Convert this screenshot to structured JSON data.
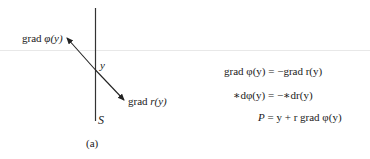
{
  "figure": {
    "caption": "(a)",
    "surface_label": "S",
    "point_label": "y",
    "arrow_up_left_label": {
      "prefix": "grad ",
      "func": "φ",
      "arg": "(y)"
    },
    "arrow_down_right_label": {
      "prefix": "grad ",
      "func": "r",
      "arg": "(y)"
    }
  },
  "equations": [
    {
      "lhs": "grad φ(y)",
      "eq": " = ",
      "rhs": "−grad r(y)"
    },
    {
      "lhs": "∗dφ(y)",
      "eq": " = ",
      "rhs": "−∗dr(y)"
    },
    {
      "lhs": "P",
      "eq": " = ",
      "rhs": "y + r grad φ(y)"
    }
  ]
}
